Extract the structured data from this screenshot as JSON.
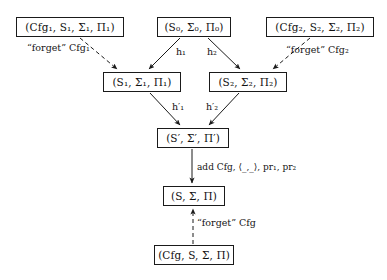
{
  "diagram": {
    "background": "#ffffff",
    "line_color": "#1a1a1a",
    "text_color": "#111111",
    "nodes": [
      {
        "id": "cfg1",
        "label": "(Cfg₁, S₁, Σ₁, Π₁)",
        "x": 16,
        "y": 17,
        "w": 108,
        "h": 20
      },
      {
        "id": "s0",
        "label": "(S₀, Σ₀, Π₀)",
        "x": 157,
        "y": 17,
        "w": 74,
        "h": 20
      },
      {
        "id": "cfg2",
        "label": "(Cfg₂, S₂, Σ₂, Π₂)",
        "x": 266,
        "y": 17,
        "w": 108,
        "h": 20
      },
      {
        "id": "s1",
        "label": "(S₁, Σ₁, Π₁)",
        "x": 103,
        "y": 72,
        "w": 78,
        "h": 20
      },
      {
        "id": "s2",
        "label": "(S₂, Σ₂, Π₂)",
        "x": 209,
        "y": 72,
        "w": 78,
        "h": 20
      },
      {
        "id": "sprime",
        "label": "(S′, Σ′, Π′)",
        "x": 157,
        "y": 128,
        "w": 72,
        "h": 20
      },
      {
        "id": "s",
        "label": "(S, Σ, Π)",
        "x": 163,
        "y": 186,
        "w": 62,
        "h": 20
      },
      {
        "id": "cfgs",
        "label": "(Cfg, S, Σ, Π)",
        "x": 154,
        "y": 245,
        "w": 80,
        "h": 20
      }
    ],
    "edge_labels": [
      {
        "id": "forget-cfg1",
        "text": "“forget” Cfg₁",
        "x": 27,
        "y": 42,
        "style": "dashed"
      },
      {
        "id": "forget-cfg2",
        "text": "“forget” Cfg₂",
        "x": 286,
        "y": 44,
        "style": "dashed"
      },
      {
        "id": "h1",
        "text": "h₁",
        "x": 176,
        "y": 46,
        "style": "solid"
      },
      {
        "id": "h2",
        "text": "h₂",
        "x": 207,
        "y": 46,
        "style": "solid"
      },
      {
        "id": "h1prime",
        "text": "h′₁",
        "x": 172,
        "y": 101,
        "style": "solid"
      },
      {
        "id": "h2prime",
        "text": "h′₂",
        "x": 206,
        "y": 101,
        "style": "solid"
      },
      {
        "id": "add-cfg",
        "text": "add Cfg, ⟨_,_⟩, pr₁, pr₂",
        "x": 197,
        "y": 162,
        "style": "solid"
      },
      {
        "id": "forget-cfg",
        "text": "“forget” Cfg",
        "x": 197,
        "y": 217,
        "style": "dashed"
      }
    ],
    "edges": [
      {
        "id": "cfg1-to-s1",
        "from": "cfg1",
        "to": "s1",
        "style": "dashed",
        "label": "forget-cfg1"
      },
      {
        "id": "s0-to-s1",
        "from": "s0",
        "to": "s1",
        "style": "solid",
        "label": "h1"
      },
      {
        "id": "s0-to-s2",
        "from": "s0",
        "to": "s2",
        "style": "solid",
        "label": "h2"
      },
      {
        "id": "cfg2-to-s2",
        "from": "cfg2",
        "to": "s2",
        "style": "dashed",
        "label": "forget-cfg2"
      },
      {
        "id": "s1-to-sprime",
        "from": "s1",
        "to": "sprime",
        "style": "solid",
        "label": "h1prime"
      },
      {
        "id": "s2-to-sprime",
        "from": "s2",
        "to": "sprime",
        "style": "solid",
        "label": "h2prime"
      },
      {
        "id": "sprime-to-s",
        "from": "sprime",
        "to": "s",
        "style": "solid",
        "label": "add-cfg"
      },
      {
        "id": "cfgs-to-s",
        "from": "cfgs",
        "to": "s",
        "style": "dashed",
        "label": "forget-cfg"
      }
    ]
  }
}
